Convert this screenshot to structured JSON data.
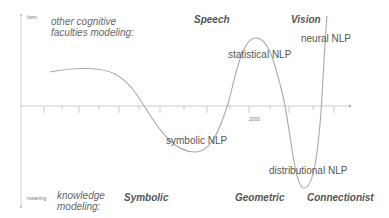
{
  "axes": {
    "y_top_label": "form",
    "y_bottom_label": "meaning",
    "x_marker_label": "2000"
  },
  "modeling": {
    "top": "other cognitive faculties modeling:",
    "top_line1": "other cognitive",
    "top_line2": "faculties modeling:",
    "bottom_line1": "knowledge",
    "bottom_line2": "modeling:"
  },
  "paradigms": {
    "top": [
      "Speech",
      "Vision"
    ],
    "bottom": [
      "Symbolic",
      "Geometric",
      "Connectionist"
    ]
  },
  "curve_labels": {
    "symbolic": "symbolic NLP",
    "statistical": "statistical NLP",
    "distributional": "distributional NLP",
    "neural": "neural NLP"
  },
  "colors": {
    "axis": "#cccccc",
    "curve": "#aaaaaa",
    "text": "#555555"
  }
}
